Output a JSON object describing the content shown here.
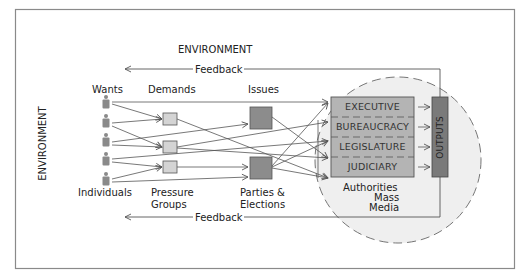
{
  "diagram": {
    "title_top": "ENVIRONMENT",
    "title_left": "ENVIRONMENT",
    "feedback_top": "Feedback",
    "feedback_bottom": "Feedback",
    "columns": {
      "wants": "Wants",
      "demands": "Demands",
      "issues": "Issues"
    },
    "bottom_labels": {
      "individuals": "Individuals",
      "pressure_groups_1": "Pressure",
      "pressure_groups_2": "Groups",
      "parties_1": "Parties &",
      "parties_2": "Elections"
    },
    "authorities": {
      "rows": [
        "EXECUTIVE",
        "BUREAUCRACY",
        "LEGISLATURE",
        "JUDICIARY"
      ],
      "caption": "Authorities",
      "mass_media_1": "Mass",
      "mass_media_2": "Media"
    },
    "outputs": "OUTPUTS",
    "colors": {
      "frame": "#8a8a8a",
      "line": "#555555",
      "demand_box": "#d4d4d4",
      "issue_box": "#8c8c8c",
      "authority_box": "#b4b4b4",
      "outputs_bar": "#7a7a7a",
      "circle_fill": "#efefef",
      "person": "#8a8a8a"
    }
  }
}
